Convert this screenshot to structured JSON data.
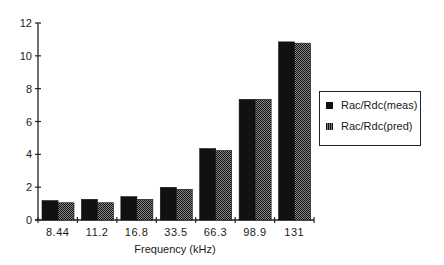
{
  "chart_data": {
    "type": "bar",
    "title": "",
    "xlabel": "Frequency (kHz)",
    "ylabel": "",
    "categories": [
      "8.44",
      "11.2",
      "16.8",
      "33.5",
      "66.3",
      "98.9",
      "131"
    ],
    "series": [
      {
        "name": "Rac/Rdc(meas)",
        "values": [
          1.18,
          1.26,
          1.42,
          1.99,
          4.35,
          7.35,
          10.85
        ],
        "color": "#111111",
        "pattern": "solid"
      },
      {
        "name": "Rac/Rdc(pred)",
        "values": [
          1.05,
          1.05,
          1.26,
          1.87,
          4.23,
          7.35,
          10.77
        ],
        "color": "#444444",
        "pattern": "dotted"
      }
    ],
    "ylim": [
      0,
      12
    ],
    "yticks": [
      0,
      2,
      4,
      6,
      8,
      10,
      12
    ],
    "grid": false,
    "legend_position": "right"
  },
  "legend": {
    "items": [
      {
        "label": "Rac/Rdc(meas)"
      },
      {
        "label": "Rac/Rdc(pred)"
      }
    ]
  }
}
